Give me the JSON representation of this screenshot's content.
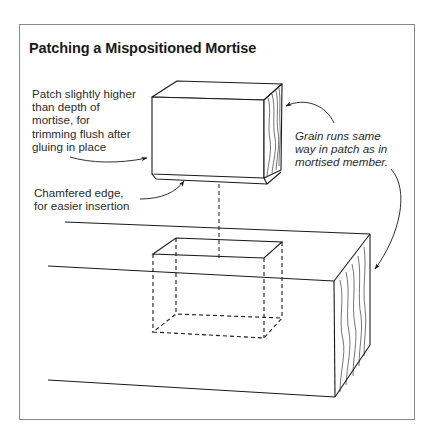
{
  "figure": {
    "title": "Patching a Mispositioned Mortise",
    "colors": {
      "line": "#1a1a1a",
      "frame": "#8a8a8a",
      "background": "#ffffff",
      "text": "#2b2b2b"
    }
  },
  "labels": {
    "patch_height": {
      "lines": [
        "Patch slightly higher",
        "than depth of",
        "mortise, for",
        "trimming flush after",
        "gluing in place"
      ]
    },
    "chamfer": {
      "lines": [
        "Chamfered edge,",
        "for easier insertion"
      ]
    },
    "grain": {
      "lines": [
        "Grain runs same",
        "way in patch as in",
        "mortised member."
      ]
    }
  },
  "elements": {
    "patch_block": "wooden patch block with end grain on right face",
    "mortise": "dashed outline of mortise cavity",
    "mortised_member": "workpiece with end grain on right face",
    "guide_line": "dashed vertical alignment line from patch to mortise"
  }
}
